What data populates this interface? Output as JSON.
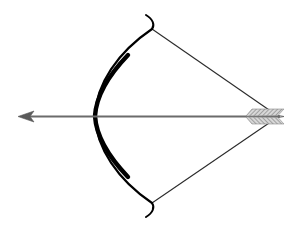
{
  "image": {
    "subject": "Bow and arrow illustration",
    "width": 294,
    "height": 232,
    "background": "#ffffff"
  },
  "colors": {
    "bow": "#000000",
    "string": "#2a2a2a",
    "arrow_shaft": "#6b6b6b",
    "arrowhead": "#5a5a5a",
    "fletching": "#8a8a8a"
  },
  "elements": {
    "bow": "bow-limb",
    "string": "bowstring",
    "arrow": "arrow",
    "arrowhead": "arrowhead",
    "fletching": "arrow-fletching"
  }
}
